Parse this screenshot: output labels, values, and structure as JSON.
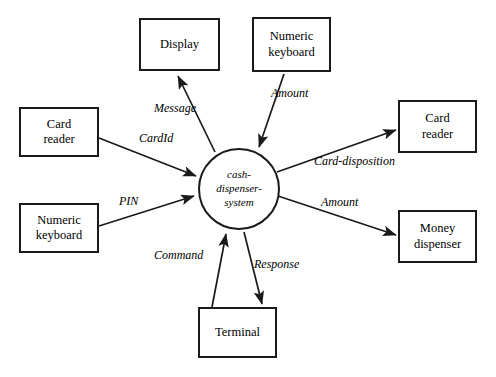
{
  "diagram": {
    "type": "data-flow-context-diagram",
    "background_color": "#ffffff",
    "line_color": "#1a1a1a",
    "text_color": "#000000"
  },
  "process": {
    "name": "cash-dispenser-system",
    "label": "cash-\ndispenser-\nsystem",
    "shape": "circle"
  },
  "entities": [
    {
      "id": "display",
      "label": "Display"
    },
    {
      "id": "numeric-keyboard-top",
      "label": "Numeric\nkeyboard"
    },
    {
      "id": "card-reader-left",
      "label": "Card\nreader"
    },
    {
      "id": "numeric-keyboard-left",
      "label": "Numeric\nkeyboard"
    },
    {
      "id": "card-reader-right",
      "label": "Card\nreader"
    },
    {
      "id": "money-dispenser",
      "label": "Money\ndispenser"
    },
    {
      "id": "terminal",
      "label": "Terminal"
    }
  ],
  "flows": [
    {
      "id": "message",
      "label": "Message",
      "from": "cash-dispenser-system",
      "to": "display"
    },
    {
      "id": "amount-in",
      "label": "Amount",
      "from": "numeric-keyboard-top",
      "to": "cash-dispenser-system"
    },
    {
      "id": "cardid",
      "label": "CardId",
      "from": "card-reader-left",
      "to": "cash-dispenser-system"
    },
    {
      "id": "pin",
      "label": "PIN",
      "from": "numeric-keyboard-left",
      "to": "cash-dispenser-system"
    },
    {
      "id": "card-disposition",
      "label": "Card-disposition",
      "from": "cash-dispenser-system",
      "to": "card-reader-right"
    },
    {
      "id": "amount-out",
      "label": "Amount",
      "from": "cash-dispenser-system",
      "to": "money-dispenser"
    },
    {
      "id": "command",
      "label": "Command",
      "from": "terminal",
      "to": "cash-dispenser-system"
    },
    {
      "id": "response",
      "label": "Response",
      "from": "cash-dispenser-system",
      "to": "terminal"
    }
  ]
}
